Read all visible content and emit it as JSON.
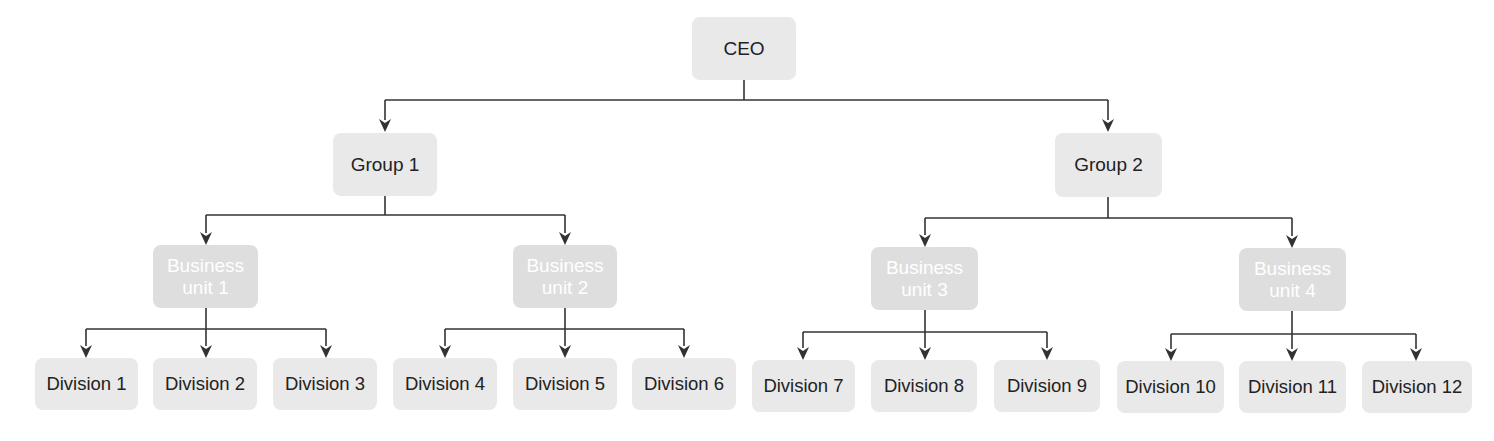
{
  "diagram": {
    "type": "org-chart",
    "colors": {
      "box_fill": "#e9e9e9",
      "business_unit_fill": "#dedede",
      "business_unit_text": "#ffffff",
      "text": "#222222",
      "connector": "#333333",
      "background": "#ffffff"
    },
    "root": {
      "label": "CEO"
    },
    "groups": [
      {
        "label": "Group 1",
        "business_units": [
          {
            "label_line1": "Business",
            "label_line2": "unit 1",
            "divisions": [
              "Division 1",
              "Division 2",
              "Division 3"
            ]
          },
          {
            "label_line1": "Business",
            "label_line2": "unit 2",
            "divisions": [
              "Division 4",
              "Division 5",
              "Division 6"
            ]
          }
        ]
      },
      {
        "label": "Group 2",
        "business_units": [
          {
            "label_line1": "Business",
            "label_line2": "unit 3",
            "divisions": [
              "Division 7",
              "Division 8",
              "Division 9"
            ]
          },
          {
            "label_line1": "Business",
            "label_line2": "unit 4",
            "divisions": [
              "Division 10",
              "Division 11",
              "Division 12"
            ]
          }
        ]
      }
    ]
  }
}
